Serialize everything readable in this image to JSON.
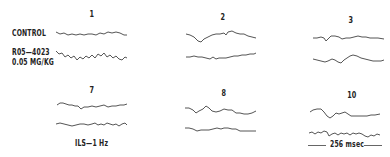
{
  "labels": {
    "control": "CONTROL",
    "drug_name": "R05—4023",
    "drug_dose": "0.05 MG/KG",
    "stimulus": "ILS—1 Hz",
    "scale_bar": "256 msec"
  },
  "panels": [
    {
      "number": "1"
    },
    {
      "number": "2"
    },
    {
      "number": "3"
    },
    {
      "number": "7"
    },
    {
      "number": "8"
    },
    {
      "number": "10"
    }
  ],
  "colors": {
    "trace": "#555555",
    "text": "#222222",
    "background": "#ffffff"
  }
}
